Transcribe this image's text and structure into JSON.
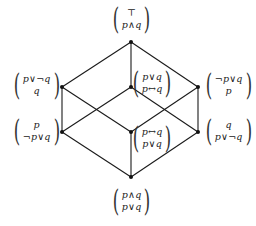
{
  "diagram": {
    "type": "hasse-lattice",
    "nodes": [
      {
        "id": "top",
        "x": 131,
        "y": 42,
        "label": [
          "⊤",
          "p∧q"
        ],
        "label_pos": {
          "left": 110,
          "top": 4
        }
      },
      {
        "id": "left-upper",
        "x": 62,
        "y": 87,
        "label": [
          "p∨¬q",
          "q"
        ],
        "label_pos": {
          "left": 11,
          "top": 70
        }
      },
      {
        "id": "center-upper",
        "x": 131,
        "y": 87,
        "label": [
          "p∨q",
          "p↔q"
        ],
        "label_pos": {
          "left": 130,
          "top": 68
        }
      },
      {
        "id": "right-upper",
        "x": 198,
        "y": 87,
        "label": [
          "¬p∨q",
          "p"
        ],
        "label_pos": {
          "left": 203,
          "top": 70
        }
      },
      {
        "id": "left-lower",
        "x": 62,
        "y": 132,
        "label": [
          "p",
          "¬p∨q"
        ],
        "label_pos": {
          "left": 11,
          "top": 116
        }
      },
      {
        "id": "center-lower",
        "x": 131,
        "y": 132,
        "label": [
          "p↔q",
          "p∨q"
        ],
        "label_pos": {
          "left": 130,
          "top": 123
        }
      },
      {
        "id": "right-lower",
        "x": 198,
        "y": 132,
        "label": [
          "q",
          "p∨¬q"
        ],
        "label_pos": {
          "left": 203,
          "top": 116
        }
      },
      {
        "id": "bottom",
        "x": 131,
        "y": 177,
        "label": [
          "p∧q",
          "p∨q"
        ],
        "label_pos": {
          "left": 110,
          "top": 186
        }
      }
    ],
    "edges": [
      [
        "top",
        "left-upper"
      ],
      [
        "top",
        "center-upper"
      ],
      [
        "top",
        "right-upper"
      ],
      [
        "left-upper",
        "left-lower"
      ],
      [
        "left-upper",
        "center-lower"
      ],
      [
        "center-upper",
        "left-lower"
      ],
      [
        "center-upper",
        "right-lower"
      ],
      [
        "right-upper",
        "right-lower"
      ],
      [
        "right-upper",
        "center-lower"
      ],
      [
        "left-lower",
        "bottom"
      ],
      [
        "center-lower",
        "bottom"
      ],
      [
        "right-lower",
        "bottom"
      ]
    ],
    "colors": {
      "line": "#1a1a1a",
      "node": "#111111",
      "background": "#ffffff"
    }
  }
}
